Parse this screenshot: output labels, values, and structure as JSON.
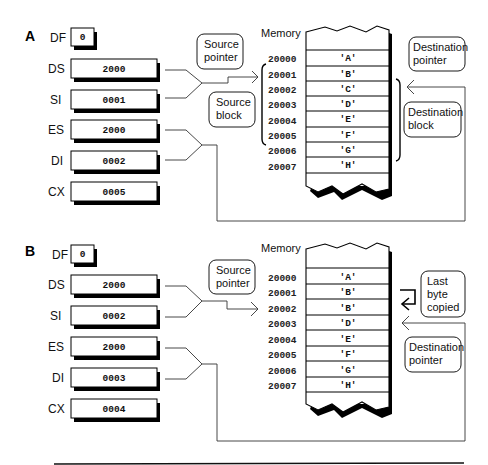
{
  "panels": [
    {
      "label": "A",
      "registers": [
        {
          "name": "DF",
          "value": "0"
        },
        {
          "name": "DS",
          "value": "2000"
        },
        {
          "name": "SI",
          "value": "0001"
        },
        {
          "name": "ES",
          "value": "2000"
        },
        {
          "name": "DI",
          "value": "0002"
        },
        {
          "name": "CX",
          "value": "0005"
        }
      ],
      "memory_title": "Memory",
      "memory": [
        {
          "address": "20000",
          "value": "'A'"
        },
        {
          "address": "20001",
          "value": "'B'"
        },
        {
          "address": "20002",
          "value": "'C'"
        },
        {
          "address": "20003",
          "value": "'D'"
        },
        {
          "address": "20004",
          "value": "'E'"
        },
        {
          "address": "20005",
          "value": "'F'"
        },
        {
          "address": "20006",
          "value": "'G'"
        },
        {
          "address": "20007",
          "value": "'H'"
        }
      ],
      "callouts": {
        "source_pointer": [
          "Source",
          "pointer"
        ],
        "source_block": [
          "Source",
          "block"
        ],
        "destination_pointer": [
          "Destination",
          "pointer"
        ],
        "destination_block": [
          "Destination",
          "block"
        ]
      }
    },
    {
      "label": "B",
      "registers": [
        {
          "name": "DF",
          "value": "0"
        },
        {
          "name": "DS",
          "value": "2000"
        },
        {
          "name": "SI",
          "value": "0002"
        },
        {
          "name": "ES",
          "value": "2000"
        },
        {
          "name": "DI",
          "value": "0003"
        },
        {
          "name": "CX",
          "value": "0004"
        }
      ],
      "memory_title": "Memory",
      "memory": [
        {
          "address": "20000",
          "value": "'A'"
        },
        {
          "address": "20001",
          "value": "'B'"
        },
        {
          "address": "20002",
          "value": "'B'"
        },
        {
          "address": "20003",
          "value": "'D'"
        },
        {
          "address": "20004",
          "value": "'E'"
        },
        {
          "address": "20005",
          "value": "'F'"
        },
        {
          "address": "20006",
          "value": "'G'"
        },
        {
          "address": "20007",
          "value": "'H'"
        }
      ],
      "callouts": {
        "source_pointer": [
          "Source",
          "pointer"
        ],
        "last_byte_copied": [
          "Last",
          "byte",
          "copied"
        ],
        "destination_pointer": [
          "Destination",
          "pointer"
        ]
      }
    }
  ]
}
